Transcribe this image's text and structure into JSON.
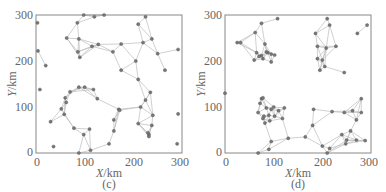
{
  "chart_data": [
    {
      "type": "scatter",
      "panel_label": "(c)",
      "title": "",
      "xlabel": "X/km",
      "ylabel": "Y/km",
      "xlim": [
        0,
        300
      ],
      "ylim": [
        0,
        300
      ],
      "xticks": [
        0,
        100,
        200,
        300
      ],
      "yticks": [
        0,
        100,
        200,
        300
      ],
      "grid": false,
      "legend": null,
      "description": "Network of nodes (gray dots) connected by light gray edges",
      "nodes": [
        [
          3,
          283
        ],
        [
          4,
          222
        ],
        [
          20,
          190
        ],
        [
          8,
          138
        ],
        [
          63,
          250
        ],
        [
          85,
          283
        ],
        [
          98,
          300
        ],
        [
          120,
          296
        ],
        [
          140,
          300
        ],
        [
          210,
          280
        ],
        [
          225,
          296
        ],
        [
          88,
          248
        ],
        [
          86,
          220
        ],
        [
          90,
          208
        ],
        [
          115,
          232
        ],
        [
          128,
          236
        ],
        [
          158,
          220
        ],
        [
          175,
          237
        ],
        [
          220,
          240
        ],
        [
          238,
          248
        ],
        [
          250,
          216
        ],
        [
          175,
          180
        ],
        [
          205,
          200
        ],
        [
          292,
          225
        ],
        [
          265,
          180
        ],
        [
          210,
          160
        ],
        [
          70,
          133
        ],
        [
          88,
          143
        ],
        [
          100,
          143
        ],
        [
          118,
          138
        ],
        [
          60,
          120
        ],
        [
          62,
          110
        ],
        [
          52,
          96
        ],
        [
          58,
          84
        ],
        [
          30,
          68
        ],
        [
          78,
          54
        ],
        [
          98,
          40
        ],
        [
          110,
          52
        ],
        [
          126,
          118
        ],
        [
          170,
          95
        ],
        [
          172,
          93
        ],
        [
          160,
          72
        ],
        [
          160,
          48
        ],
        [
          112,
          6
        ],
        [
          88,
          0
        ],
        [
          150,
          20
        ],
        [
          36,
          14
        ],
        [
          235,
          132
        ],
        [
          225,
          115
        ],
        [
          215,
          100
        ],
        [
          240,
          82
        ],
        [
          238,
          60
        ],
        [
          210,
          64
        ],
        [
          232,
          40
        ],
        [
          232,
          36
        ],
        [
          230,
          44
        ],
        [
          292,
          85
        ],
        [
          290,
          20
        ]
      ],
      "node_color": "#777777",
      "edge_color": "#bbbbbb"
    },
    {
      "type": "scatter",
      "panel_label": "(d)",
      "title": "",
      "xlabel": "X/km",
      "ylabel": "Y/km",
      "xlim": [
        0,
        300
      ],
      "ylim": [
        0,
        300
      ],
      "xticks": [
        0,
        100,
        200,
        300
      ],
      "yticks": [
        0,
        100,
        200,
        300
      ],
      "grid": false,
      "legend": null,
      "description": "Network of nodes in four clusters connected by light gray edges",
      "nodes": [
        [
          0,
          130
        ],
        [
          75,
          282
        ],
        [
          108,
          292
        ],
        [
          62,
          262
        ],
        [
          25,
          240
        ],
        [
          32,
          240
        ],
        [
          82,
          237
        ],
        [
          65,
          218
        ],
        [
          75,
          212
        ],
        [
          88,
          218
        ],
        [
          95,
          215
        ],
        [
          102,
          213
        ],
        [
          60,
          202
        ],
        [
          70,
          210
        ],
        [
          78,
          205
        ],
        [
          95,
          198
        ],
        [
          85,
          220
        ],
        [
          186,
          260
        ],
        [
          210,
          292
        ],
        [
          215,
          278
        ],
        [
          190,
          232
        ],
        [
          208,
          228
        ],
        [
          228,
          232
        ],
        [
          190,
          205
        ],
        [
          200,
          202
        ],
        [
          205,
          188
        ],
        [
          195,
          180
        ],
        [
          245,
          175
        ],
        [
          272,
          260
        ],
        [
          292,
          278
        ],
        [
          75,
          118
        ],
        [
          78,
          120
        ],
        [
          72,
          108
        ],
        [
          85,
          98
        ],
        [
          95,
          95
        ],
        [
          100,
          100
        ],
        [
          110,
          92
        ],
        [
          122,
          98
        ],
        [
          68,
          88
        ],
        [
          80,
          80
        ],
        [
          90,
          82
        ],
        [
          102,
          80
        ],
        [
          118,
          75
        ],
        [
          78,
          75
        ],
        [
          92,
          70
        ],
        [
          82,
          65
        ],
        [
          130,
          32
        ],
        [
          95,
          25
        ],
        [
          90,
          8
        ],
        [
          68,
          0
        ],
        [
          165,
          35
        ],
        [
          180,
          60
        ],
        [
          182,
          95
        ],
        [
          220,
          90
        ],
        [
          245,
          88
        ],
        [
          262,
          92
        ],
        [
          280,
          118
        ],
        [
          270,
          72
        ],
        [
          280,
          88
        ],
        [
          240,
          40
        ],
        [
          258,
          48
        ],
        [
          250,
          28
        ],
        [
          248,
          20
        ],
        [
          270,
          28
        ],
        [
          288,
          27
        ],
        [
          200,
          15
        ],
        [
          210,
          0
        ],
        [
          215,
          10
        ]
      ],
      "node_color": "#777777",
      "edge_color": "#bbbbbb"
    }
  ],
  "panels": {
    "c": {
      "caption": "(c)",
      "xlabel_var": "X",
      "xlabel_unit": "/km",
      "ylabel_var": "Y",
      "ylabel_unit": "/km",
      "xticks": [
        "0",
        "100",
        "200",
        "300"
      ],
      "yticks": [
        "0",
        "100",
        "200",
        "300"
      ]
    },
    "d": {
      "caption": "(d)",
      "xlabel_var": "X",
      "xlabel_unit": "/km",
      "ylabel_var": "Y",
      "ylabel_unit": "/km",
      "xticks": [
        "0",
        "100",
        "200",
        "300"
      ],
      "yticks": [
        "0",
        "100",
        "200",
        "300"
      ]
    }
  }
}
